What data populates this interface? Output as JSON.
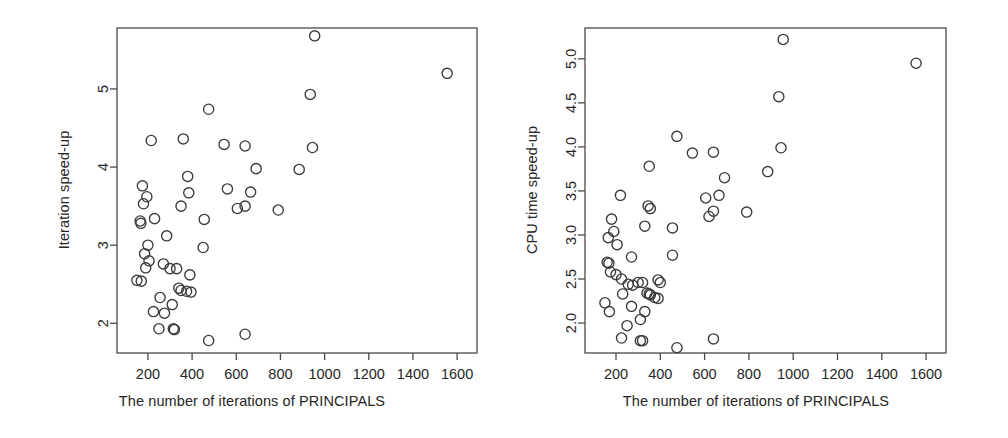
{
  "figure": {
    "background": "#ffffff",
    "marker_color": "#3a3a3a",
    "axis_color": "#4a4a4a",
    "panel_count": 2
  },
  "chart_data": [
    {
      "type": "scatter",
      "panel": "left",
      "title": "",
      "xlabel": "The number of iterations of PRINCIPALS",
      "ylabel": "Iteration speed-up",
      "xlim": [
        60,
        1690
      ],
      "ylim": [
        1.62,
        5.78
      ],
      "grid": false,
      "legend": null,
      "xticks": [
        200,
        400,
        600,
        800,
        1000,
        1200,
        1400,
        1600
      ],
      "xtick_labels": [
        "200",
        "400",
        "600",
        "800",
        "1000",
        "1200",
        "1400",
        "1600"
      ],
      "yticks": [
        2,
        3,
        4,
        5
      ],
      "ytick_labels": [
        "2",
        "3",
        "4",
        "5"
      ],
      "marker": "open-circle",
      "points": [
        [
          955,
          5.68
        ],
        [
          1555,
          5.2
        ],
        [
          935,
          4.93
        ],
        [
          475,
          4.74
        ],
        [
          215,
          4.34
        ],
        [
          360,
          4.36
        ],
        [
          545,
          4.29
        ],
        [
          640,
          4.27
        ],
        [
          945,
          4.25
        ],
        [
          380,
          3.88
        ],
        [
          885,
          3.97
        ],
        [
          690,
          3.98
        ],
        [
          175,
          3.76
        ],
        [
          560,
          3.72
        ],
        [
          385,
          3.67
        ],
        [
          195,
          3.62
        ],
        [
          180,
          3.53
        ],
        [
          665,
          3.68
        ],
        [
          350,
          3.5
        ],
        [
          605,
          3.47
        ],
        [
          640,
          3.5
        ],
        [
          790,
          3.45
        ],
        [
          165,
          3.31
        ],
        [
          168,
          3.28
        ],
        [
          230,
          3.34
        ],
        [
          455,
          3.33
        ],
        [
          285,
          3.12
        ],
        [
          200,
          3.0
        ],
        [
          450,
          2.97
        ],
        [
          185,
          2.89
        ],
        [
          205,
          2.8
        ],
        [
          270,
          2.76
        ],
        [
          190,
          2.71
        ],
        [
          300,
          2.7
        ],
        [
          330,
          2.7
        ],
        [
          150,
          2.55
        ],
        [
          170,
          2.54
        ],
        [
          390,
          2.62
        ],
        [
          340,
          2.45
        ],
        [
          350,
          2.42
        ],
        [
          375,
          2.41
        ],
        [
          395,
          2.4
        ],
        [
          255,
          2.33
        ],
        [
          310,
          2.24
        ],
        [
          225,
          2.15
        ],
        [
          275,
          2.13
        ],
        [
          250,
          1.93
        ],
        [
          315,
          1.93
        ],
        [
          320,
          1.92
        ],
        [
          475,
          1.78
        ],
        [
          640,
          1.86
        ]
      ]
    },
    {
      "type": "scatter",
      "panel": "right",
      "title": "",
      "xlabel": "The number of iterations of PRINCIPALS",
      "ylabel": "CPU time speed-up",
      "xlim": [
        60,
        1690
      ],
      "ylim": [
        1.66,
        5.35
      ],
      "grid": false,
      "legend": null,
      "xticks": [
        200,
        400,
        600,
        800,
        1000,
        1200,
        1400,
        1600
      ],
      "xtick_labels": [
        "200",
        "400",
        "600",
        "800",
        "1000",
        "1200",
        "1400",
        "1600"
      ],
      "yticks": [
        2.0,
        2.5,
        3.0,
        3.5,
        4.0,
        4.5,
        5.0
      ],
      "ytick_labels": [
        "2.0",
        "2.5",
        "3.0",
        "3.5",
        "4.0",
        "4.5",
        "5.0"
      ],
      "marker": "open-circle",
      "points": [
        [
          955,
          5.22
        ],
        [
          1555,
          4.95
        ],
        [
          935,
          4.57
        ],
        [
          475,
          4.12
        ],
        [
          945,
          3.99
        ],
        [
          545,
          3.93
        ],
        [
          640,
          3.94
        ],
        [
          350,
          3.78
        ],
        [
          885,
          3.72
        ],
        [
          690,
          3.65
        ],
        [
          220,
          3.45
        ],
        [
          605,
          3.42
        ],
        [
          665,
          3.45
        ],
        [
          345,
          3.33
        ],
        [
          355,
          3.3
        ],
        [
          640,
          3.27
        ],
        [
          790,
          3.26
        ],
        [
          620,
          3.21
        ],
        [
          180,
          3.18
        ],
        [
          330,
          3.1
        ],
        [
          455,
          3.08
        ],
        [
          190,
          3.04
        ],
        [
          165,
          2.97
        ],
        [
          205,
          2.89
        ],
        [
          455,
          2.77
        ],
        [
          270,
          2.75
        ],
        [
          160,
          2.69
        ],
        [
          168,
          2.68
        ],
        [
          175,
          2.58
        ],
        [
          200,
          2.55
        ],
        [
          225,
          2.5
        ],
        [
          390,
          2.49
        ],
        [
          300,
          2.46
        ],
        [
          320,
          2.46
        ],
        [
          255,
          2.44
        ],
        [
          275,
          2.43
        ],
        [
          400,
          2.46
        ],
        [
          340,
          2.34
        ],
        [
          350,
          2.33
        ],
        [
          355,
          2.32
        ],
        [
          375,
          2.29
        ],
        [
          390,
          2.28
        ],
        [
          230,
          2.33
        ],
        [
          150,
          2.23
        ],
        [
          270,
          2.19
        ],
        [
          330,
          2.13
        ],
        [
          170,
          2.13
        ],
        [
          250,
          1.97
        ],
        [
          310,
          2.04
        ],
        [
          225,
          1.83
        ],
        [
          310,
          1.8
        ],
        [
          320,
          1.8
        ],
        [
          640,
          1.82
        ],
        [
          475,
          1.72
        ]
      ]
    }
  ]
}
